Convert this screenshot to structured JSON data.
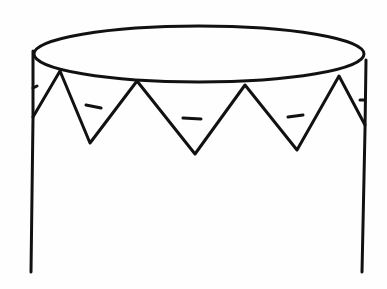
{
  "figure": {
    "description": "Outline of a cylindrical drum with an elliptical top and a zigzag triangle band below the rim; each of the three front triangles contains a short dash mark.",
    "stroke_color": "#111111",
    "background_color": "#fefefe",
    "triangle_count_front": 3,
    "dash_marks": 3
  }
}
